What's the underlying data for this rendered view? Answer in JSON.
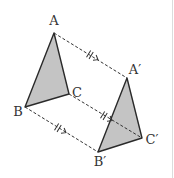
{
  "diagram": {
    "type": "geometric translation",
    "colors": {
      "fill": "#c4c4c4",
      "stroke": "#2a2a2a",
      "dash": "#333333",
      "label": "#333333"
    },
    "original_triangle": {
      "vertices": {
        "A": {
          "label": "A",
          "x": 54,
          "y": 33,
          "lx": 54,
          "ly": 25
        },
        "B": {
          "label": "B",
          "x": 25,
          "y": 107,
          "lx": 18,
          "ly": 116
        },
        "C": {
          "label": "C",
          "x": 69,
          "y": 94,
          "lx": 78,
          "ly": 97
        }
      }
    },
    "image_triangle": {
      "vertices": {
        "A": {
          "label": "A′",
          "x": 127,
          "y": 78,
          "lx": 135,
          "ly": 74
        },
        "B": {
          "label": "B′",
          "x": 98,
          "y": 152,
          "lx": 100,
          "ly": 166
        },
        "C": {
          "label": "C′",
          "x": 142,
          "y": 138,
          "lx": 152,
          "ly": 144
        }
      }
    },
    "translation_segments": [
      {
        "from": "A",
        "to": "A′",
        "marker": "double-tick",
        "arrow": true
      },
      {
        "from": "C",
        "to": "C′",
        "marker": "double-tick",
        "arrow": true
      },
      {
        "from": "B",
        "to": "B′",
        "marker": "double-tick",
        "arrow": true
      }
    ],
    "labels": {
      "A": "A",
      "B": "B",
      "C": "C",
      "A_prime": "A′",
      "B_prime": "B′",
      "C_prime": "C′"
    }
  }
}
